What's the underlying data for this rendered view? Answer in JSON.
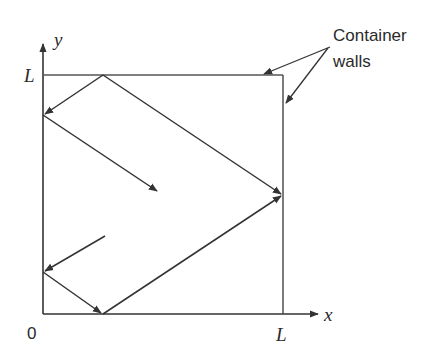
{
  "diagram": {
    "type": "particle-in-box-collisions",
    "axes": {
      "x_label": "x",
      "y_label": "y",
      "origin_label": "0",
      "x_end_label": "L",
      "y_end_label": "L"
    },
    "annotation": {
      "line1": "Container",
      "line2": "walls"
    },
    "colors": {
      "stroke": "#333333",
      "background": "#ffffff"
    }
  }
}
